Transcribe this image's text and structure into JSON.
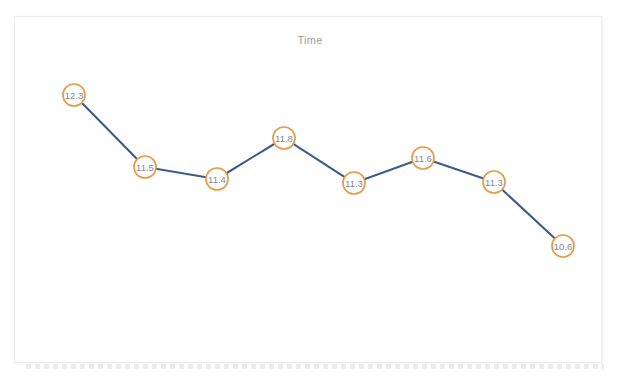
{
  "card": {
    "title": "Time",
    "background_color": "#ffffff",
    "border_color": "#ededf0"
  },
  "chart_data": {
    "type": "line",
    "title": "Time",
    "xlabel": "",
    "ylabel": "",
    "x": [
      1,
      2,
      3,
      4,
      5,
      6,
      7,
      8
    ],
    "values": [
      12.3,
      11.5,
      11.4,
      11.8,
      11.3,
      11.6,
      11.3,
      10.6
    ],
    "point_labels": [
      "12.3",
      "11.5",
      "11.4",
      "11.8",
      "11.3",
      "11.6",
      "11.3",
      "10.6"
    ],
    "categories": [
      "",
      "",
      "",
      "",
      "",
      "",
      "",
      ""
    ],
    "xtick_labels": [],
    "ytick_labels": [],
    "ylim": [
      10.3,
      12.6
    ],
    "grid": false,
    "legend": null,
    "legend_position": "none",
    "series": [
      {
        "name": "Time",
        "values": [
          12.3,
          11.5,
          11.4,
          11.8,
          11.3,
          11.6,
          11.3,
          10.6
        ],
        "line_color": "#3c5c8e",
        "marker_edge_color": "#e89b47",
        "marker_fill_color": "#ffffff",
        "label_color": "#7d879b",
        "marker_shape": "circle",
        "marker_radius_px": 11,
        "labels_inside_markers": true
      }
    ],
    "points": [
      {
        "index": 1,
        "label": "12.3",
        "value": 12.3,
        "cx": 74,
        "cy": 95
      },
      {
        "index": 2,
        "label": "11.5",
        "value": 11.5,
        "cx": 145,
        "cy": 167
      },
      {
        "index": 3,
        "label": "11.4",
        "value": 11.4,
        "cx": 217,
        "cy": 179
      },
      {
        "index": 4,
        "label": "11.8",
        "value": 11.8,
        "cx": 284,
        "cy": 138
      },
      {
        "index": 5,
        "label": "11.3",
        "value": 11.3,
        "cx": 354,
        "cy": 183
      },
      {
        "index": 6,
        "label": "11.6",
        "value": 11.6,
        "cx": 423,
        "cy": 158
      },
      {
        "index": 7,
        "label": "11.3",
        "value": 11.3,
        "cx": 494,
        "cy": 182
      },
      {
        "index": 8,
        "label": "10.6",
        "value": 10.6,
        "cx": 563,
        "cy": 246
      }
    ]
  }
}
